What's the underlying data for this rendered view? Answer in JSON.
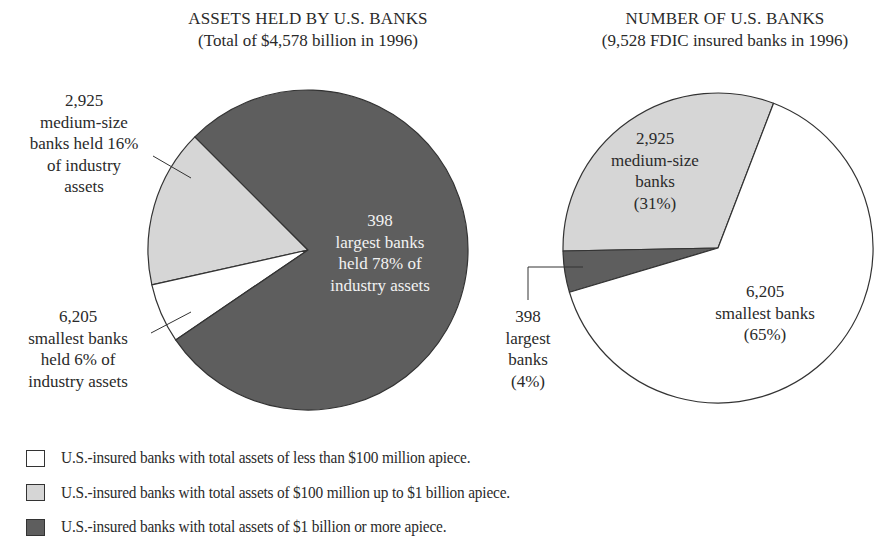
{
  "colors": {
    "small": "#ffffff",
    "medium": "#d6d6d6",
    "large": "#5e5e5e",
    "outline": "#333333"
  },
  "chart_data": [
    {
      "type": "pie",
      "title": "ASSETS HELD BY U.S. BANKS",
      "subtitle": "(Total of $4,578 billion in 1996)",
      "categories": [
        "smallest banks",
        "medium-size banks",
        "largest banks"
      ],
      "values": [
        6,
        16,
        78
      ],
      "unit": "% of industry assets",
      "bank_counts": [
        6205,
        2925,
        398
      ],
      "total": "$4,578 billion",
      "year": 1996,
      "slices": [
        {
          "key": "large",
          "label": "398 largest banks held 78% of industry assets",
          "percent": 78,
          "count": 398
        },
        {
          "key": "medium",
          "label": "2,925 medium-size banks held 16% of industry assets",
          "percent": 16,
          "count": 2925
        },
        {
          "key": "small",
          "label": "6,205 smallest banks held 6% of industry assets",
          "percent": 6,
          "count": 6205
        }
      ]
    },
    {
      "type": "pie",
      "title": "NUMBER OF U.S. BANKS",
      "subtitle": "(9,528 FDIC insured banks in 1996)",
      "categories": [
        "smallest banks",
        "medium-size banks",
        "largest banks"
      ],
      "values": [
        65,
        31,
        4
      ],
      "unit": "% of banks",
      "bank_counts": [
        6205,
        2925,
        398
      ],
      "total": 9528,
      "year": 1996,
      "slices": [
        {
          "key": "small",
          "label": "6,205 smallest banks (65%)",
          "percent": 65,
          "count": 6205
        },
        {
          "key": "medium",
          "label": "2,925 medium-size banks (31%)",
          "percent": 31,
          "count": 2925
        },
        {
          "key": "large",
          "label": "398 largest banks (4%)",
          "percent": 4,
          "count": 398
        }
      ]
    }
  ],
  "geometry": {
    "left": {
      "cx": 308,
      "cy": 250,
      "r": 160,
      "arcs": [
        {
          "key": "medium",
          "start": 167.4,
          "end": 225.0
        },
        {
          "key": "small",
          "start": 145.8,
          "end": 167.4
        },
        {
          "key": "large",
          "start": 225.0,
          "end": 505.8
        }
      ]
    },
    "right": {
      "cx": 718,
      "cy": 248,
      "r": 155,
      "arcs": [
        {
          "key": "medium",
          "start": 178.9,
          "end": 291.0
        },
        {
          "key": "large",
          "start": 163.4,
          "end": 178.9
        },
        {
          "key": "small",
          "start": 291.0,
          "end": 523.4
        }
      ]
    }
  },
  "left_chart": {
    "title": "ASSETS HELD BY U.S. BANKS",
    "subtitle": "(Total of $4,578 billion in 1996)",
    "medium_label": [
      "2,925",
      "medium-size",
      "banks held 16%",
      "of industry",
      "assets"
    ],
    "small_label": [
      "6,205",
      "smallest banks",
      "held 6% of",
      "industry assets"
    ],
    "large_label": [
      "398",
      "largest banks",
      "held 78% of",
      "industry assets"
    ]
  },
  "right_chart": {
    "title": "NUMBER OF U.S. BANKS",
    "subtitle": "(9,528 FDIC insured banks in 1996)",
    "medium_label": [
      "2,925",
      "medium-size",
      "banks",
      "(31%)"
    ],
    "small_label": [
      "6,205",
      "smallest banks",
      "(65%)"
    ],
    "large_label": [
      "398",
      "largest",
      "banks",
      "(4%)"
    ]
  },
  "legend": [
    {
      "key": "small",
      "text": "U.S.-insured banks with total assets of less than $100 million apiece."
    },
    {
      "key": "medium",
      "text": "U.S.-insured banks with total assets of $100 million up to $1 billion apiece."
    },
    {
      "key": "large",
      "text": "U.S.-insured banks with total assets of $1 billion or more apiece."
    }
  ]
}
